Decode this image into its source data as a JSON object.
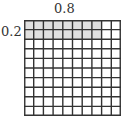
{
  "diagram": {
    "type": "decimal-multiplication-grid",
    "grid": {
      "rows": 10,
      "cols": 10
    },
    "shaded": {
      "rows": 2,
      "cols": 8,
      "color": "#e0e0e0"
    },
    "line_color": "#333333",
    "labels": {
      "top": "0.8",
      "left": "0.2"
    }
  }
}
